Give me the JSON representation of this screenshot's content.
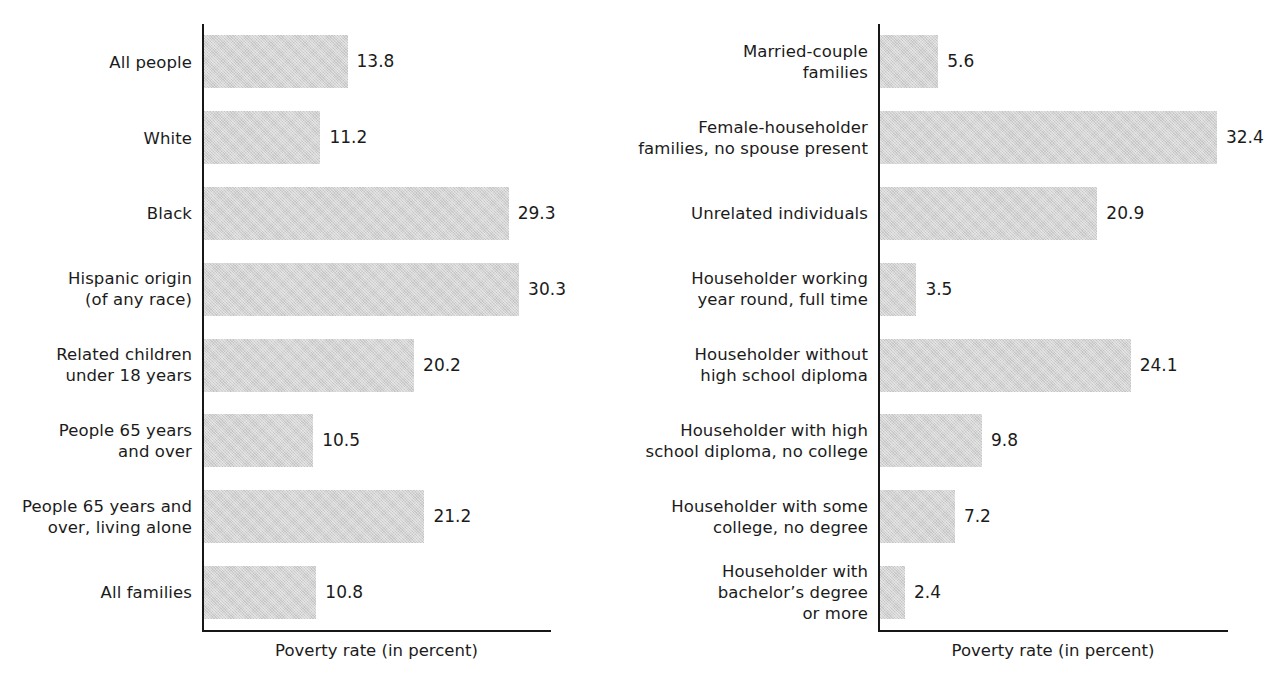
{
  "figure": {
    "background_color": "#ffffff",
    "bar_color": "#d3d3d3",
    "axis_color": "#171717",
    "text_color": "#1b1b1b"
  },
  "chart_data": [
    {
      "type": "bar",
      "orientation": "horizontal",
      "panel": "left",
      "title": "",
      "xlabel": "Poverty rate (in percent)",
      "ylabel": "",
      "xlim": [
        0,
        34
      ],
      "grid": false,
      "legend": "none",
      "value_labels": true,
      "categories": [
        "All people",
        "White",
        "Black",
        "Hispanic origin\n(of any race)",
        "Related children\nunder 18 years",
        "People 65 years\nand over",
        "People 65 years and\nover, living alone",
        "All families"
      ],
      "values": [
        13.8,
        11.2,
        29.3,
        30.3,
        20.2,
        10.5,
        21.2,
        10.8
      ],
      "value_text": [
        "13.8",
        "11.2",
        "29.3",
        "30.3",
        "20.2",
        "10.5",
        "21.2",
        "10.8"
      ]
    },
    {
      "type": "bar",
      "orientation": "horizontal",
      "panel": "right",
      "title": "",
      "xlabel": "Poverty rate (in percent)",
      "ylabel": "",
      "xlim": [
        0,
        34
      ],
      "grid": false,
      "legend": "none",
      "value_labels": true,
      "categories": [
        "Married-couple\nfamilies",
        "Female-householder\nfamilies, no spouse present",
        "Unrelated individuals",
        "Householder working\nyear round, full time",
        "Householder without\nhigh school diploma",
        "Householder with high\nschool diploma, no college",
        "Householder with some\ncollege, no degree",
        "Householder with\nbachelor’s degree\nor more"
      ],
      "values": [
        5.6,
        32.4,
        20.9,
        3.5,
        24.1,
        9.8,
        7.2,
        2.4
      ],
      "value_text": [
        "5.6",
        "32.4",
        "20.9",
        "3.5",
        "24.1",
        "9.8",
        "7.2",
        "2.4"
      ]
    }
  ]
}
